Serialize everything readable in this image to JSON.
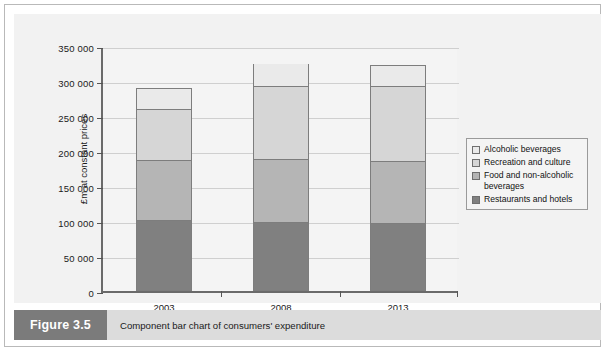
{
  "figure": {
    "number_label": "Figure 3.5",
    "caption": "Component bar chart of consumers' expenditure"
  },
  "colors": {
    "alcoholic": "#eaeaea",
    "recreation": "#d6d6d6",
    "food": "#b5b5b5",
    "restaurants": "#808080",
    "bar_outline": "#7d7d7d",
    "axis": "#6a6a6a",
    "gridline": "#cfcfcf",
    "panel_background": "#f2f2f2",
    "plot_background": "#f4f4f4",
    "caption_strip": "#dcdcdc",
    "figure_number_background": "#7b7b7b"
  },
  "chart_data": {
    "type": "bar",
    "stacked": true,
    "title": "",
    "xlabel": "",
    "ylabel": "£m at constant prices",
    "categories": [
      "2003",
      "2008",
      "2013"
    ],
    "ylim": [
      0,
      350000
    ],
    "yticks": [
      0,
      50000,
      100000,
      150000,
      200000,
      250000,
      300000,
      350000
    ],
    "ytick_labels": [
      "0",
      "50 000",
      "100 000",
      "150 000",
      "200 000",
      "250 000",
      "300 000",
      "350 000"
    ],
    "grid": true,
    "legend_position": "right",
    "series": [
      {
        "name": "Restaurants and hotels",
        "color": "#808080",
        "values": [
          100000,
          97000,
          95000
        ]
      },
      {
        "name": "Food and non-alcoholic beverages",
        "color": "#b5b5b5",
        "values": [
          86000,
          90000,
          89000
        ]
      },
      {
        "name": "Recreation and culture",
        "color": "#d6d6d6",
        "values": [
          74000,
          105000,
          108000
        ]
      },
      {
        "name": "Alcoholic beverages",
        "color": "#eaeaea",
        "values": [
          30000,
          33000,
          31000
        ]
      }
    ],
    "totals": [
      290000,
      325000,
      323000
    ],
    "legend_entries": [
      "Alcoholic beverages",
      "Recreation and culture",
      "Food and non-alcoholic beverages",
      "Restaurants and hotels"
    ]
  }
}
